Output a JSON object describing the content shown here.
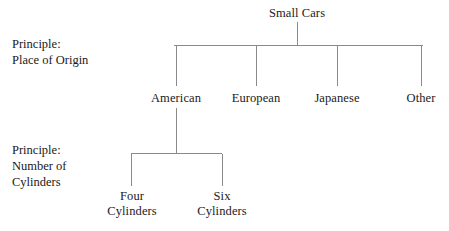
{
  "diagram": {
    "type": "hierarchy-tree",
    "background_color": "#ffffff",
    "line_color": "#8a8a8a",
    "text_color": "#1a1a1a",
    "root": {
      "label": "Small Cars",
      "x": 297,
      "y": 17
    },
    "side_labels": [
      {
        "id": "origin",
        "line1": "Principle:",
        "line2": "Place of Origin",
        "x": 12,
        "y": 36
      },
      {
        "id": "cylinders",
        "line1": "Principle:",
        "line2": "Number of",
        "line3": "Cylinders",
        "x": 12,
        "y": 142
      }
    ],
    "level1": {
      "bar_y": 45,
      "bar_x1": 174,
      "bar_x2": 423,
      "stem_bottom": 86,
      "label_y": 92,
      "nodes": [
        {
          "label": "American",
          "x": 176
        },
        {
          "label": "European",
          "x": 256
        },
        {
          "label": "Japanese",
          "x": 337
        },
        {
          "label": "Other",
          "x": 421
        }
      ]
    },
    "level2": {
      "parent": "American",
      "stem_top": 108,
      "bar_y": 153,
      "bar_x1": 131,
      "bar_x2": 222,
      "stem_bottom": 186,
      "label_y": 191,
      "nodes": [
        {
          "line1": "Four",
          "line2": "Cylinders",
          "x": 132
        },
        {
          "line1": "Six",
          "line2": "Cylinders",
          "x": 222
        }
      ]
    }
  }
}
